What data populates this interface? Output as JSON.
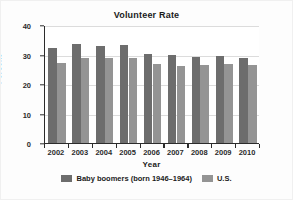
{
  "chart_data": {
    "type": "bar",
    "title": "Volunteer Rate",
    "xlabel": "Year",
    "ylabel": "Percent",
    "categories": [
      "2002",
      "2003",
      "2004",
      "2005",
      "2006",
      "2007",
      "2008",
      "2009",
      "2010"
    ],
    "series": [
      {
        "name": "Baby boomers (born 1946–1964)",
        "color": "#6d6d6d",
        "values": [
          32.2,
          33.4,
          33.0,
          33.1,
          30.3,
          29.8,
          29.2,
          29.6,
          28.7
        ]
      },
      {
        "name": "U.S.",
        "color": "#949494",
        "values": [
          27.2,
          28.8,
          28.8,
          28.8,
          26.7,
          26.2,
          26.4,
          26.8,
          26.3
        ]
      }
    ],
    "ylim": [
      0,
      40
    ],
    "yticks": [
      0,
      10,
      20,
      30,
      40
    ],
    "ytick_labels": [
      "0",
      "10",
      "20",
      "30",
      "40"
    ],
    "grid": true,
    "legend_position": "bottom"
  },
  "legend": {
    "entries": [
      {
        "label": "Baby boomers (born 1946–1964)",
        "color": "#6d6d6d"
      },
      {
        "label": "U.S.",
        "color": "#949494"
      }
    ]
  },
  "colors": {
    "boomers": "#6d6d6d",
    "us": "#949494",
    "axis": "#2b2b2b",
    "grid": "#dcdcdc",
    "plot_background": "#ffffff",
    "figure_background": "#fdfdfd"
  }
}
